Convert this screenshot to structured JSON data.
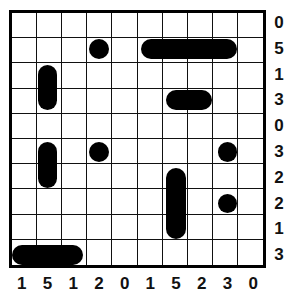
{
  "puzzle": {
    "type": "battleships",
    "size": 10,
    "row_clues": [
      "0",
      "5",
      "1",
      "3",
      "0",
      "3",
      "2",
      "2",
      "1",
      "3"
    ],
    "col_clues": [
      "1",
      "5",
      "1",
      "2",
      "0",
      "1",
      "5",
      "2",
      "3",
      "0"
    ],
    "ships": [
      {
        "row": 1,
        "col": 3,
        "length": 1,
        "orientation": "single"
      },
      {
        "row": 1,
        "col": 5,
        "length": 4,
        "orientation": "horizontal"
      },
      {
        "row": 2,
        "col": 1,
        "length": 2,
        "orientation": "vertical"
      },
      {
        "row": 3,
        "col": 6,
        "length": 2,
        "orientation": "horizontal"
      },
      {
        "row": 5,
        "col": 1,
        "length": 2,
        "orientation": "vertical"
      },
      {
        "row": 5,
        "col": 3,
        "length": 1,
        "orientation": "single"
      },
      {
        "row": 5,
        "col": 8,
        "length": 1,
        "orientation": "single"
      },
      {
        "row": 6,
        "col": 6,
        "length": 3,
        "orientation": "vertical"
      },
      {
        "row": 7,
        "col": 8,
        "length": 1,
        "orientation": "single"
      },
      {
        "row": 9,
        "col": 0,
        "length": 3,
        "orientation": "horizontal"
      }
    ],
    "colors": {
      "ship": "#000000",
      "grid": "#111111",
      "background": "#ffffff"
    }
  }
}
